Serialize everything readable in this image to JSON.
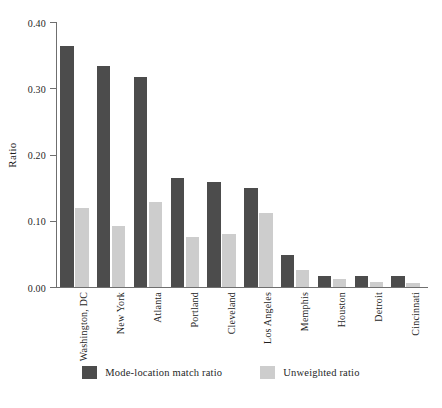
{
  "chart_data": {
    "type": "bar",
    "title": "",
    "xlabel": "",
    "ylabel": "Ratio",
    "ylim": [
      0.0,
      0.4
    ],
    "yticks": [
      "0.00",
      "0.10",
      "0.20",
      "0.30",
      "0.40"
    ],
    "ytick_values": [
      0.0,
      0.1,
      0.2,
      0.3,
      0.4
    ],
    "grid": false,
    "legend_position": "bottom-center",
    "categories": [
      "Washington, DC",
      "New York",
      "Atlanta",
      "Portland",
      "Cleveland",
      "Los Angeles",
      "Memphis",
      "Houston",
      "Detroit",
      "Cincinnati"
    ],
    "series": [
      {
        "name": "Mode-location match ratio",
        "color": "#4c4c4c",
        "values": [
          0.364,
          0.334,
          0.317,
          0.164,
          0.158,
          0.15,
          0.049,
          0.017,
          0.017,
          0.016
        ]
      },
      {
        "name": "Unweighted ratio",
        "color": "#cdcdcd",
        "values": [
          0.12,
          0.092,
          0.129,
          0.075,
          0.08,
          0.112,
          0.026,
          0.012,
          0.008,
          0.006
        ]
      }
    ]
  },
  "legend": {
    "items": [
      {
        "label": "Mode-location match ratio",
        "swatch": "dark"
      },
      {
        "label": "Unweighted ratio",
        "swatch": "light"
      }
    ]
  }
}
